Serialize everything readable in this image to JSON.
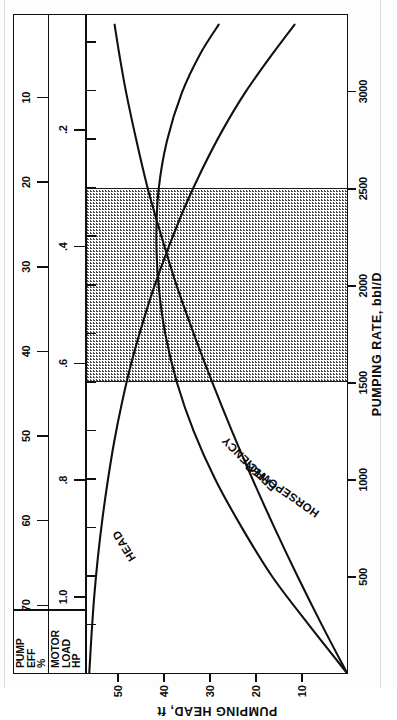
{
  "figure": {
    "title_note": "Centrifugal pump performance curves",
    "orientation": "rotated-90-ccw"
  },
  "aux_scales": [
    {
      "id": "pump-eff",
      "title": "PUMP\nEFF\n%",
      "unit": "%",
      "ticks": [
        70,
        60,
        50,
        40,
        30,
        20,
        10
      ],
      "tick_labels": [
        "70",
        "60",
        "50",
        "40",
        "30",
        "20",
        "10"
      ]
    },
    {
      "id": "motor-load",
      "title": "MOTOR\nLOAD\nHP",
      "unit": "HP",
      "ticks": [
        1.0,
        0.8,
        0.6,
        0.4,
        0.2
      ],
      "tick_labels": [
        "1.0",
        ".8",
        ".6",
        ".4",
        ".2"
      ]
    }
  ],
  "chart_data": {
    "type": "line",
    "title": "",
    "xlabel": "PUMPING RATE, bbl/D",
    "ylabel": "PUMPING HEAD, ft",
    "xlim": [
      0,
      3400
    ],
    "ylim": [
      0,
      57
    ],
    "xticks": [
      500,
      1000,
      1500,
      2000,
      2500,
      3000
    ],
    "xtick_labels": [
      "500",
      "1000",
      "1500",
      "2000",
      "2500",
      "3000"
    ],
    "yticks": [
      10,
      20,
      30,
      40,
      50
    ],
    "ytick_labels": [
      "10",
      "20",
      "30",
      "40",
      "50"
    ],
    "grid": false,
    "legend": "inline-curve-labels",
    "shaded_region": {
      "label": "recommended operating range",
      "x_start": 1500,
      "x_end": 2500,
      "fill": "#ffffff",
      "pattern": "dotted-stipple"
    },
    "series": [
      {
        "name": "HEAD",
        "label": "HEAD",
        "axis": "PUMPING HEAD, ft",
        "color": "#101010",
        "x": [
          0,
          200,
          400,
          600,
          800,
          1000,
          1200,
          1400,
          1600,
          1800,
          2000,
          2200,
          2400,
          2600,
          2800,
          3000,
          3200,
          3350
        ],
        "y": [
          56.5,
          56.0,
          55.4,
          54.6,
          53.6,
          52.4,
          51.0,
          49.3,
          47.3,
          44.9,
          42.2,
          39.1,
          35.7,
          31.8,
          27.4,
          22.3,
          16.3,
          11.5
        ]
      },
      {
        "name": "EFFICIENCY",
        "label": "EFFICIENCY",
        "axis": "PUMP EFF %",
        "color": "#101010",
        "x": [
          0,
          250,
          500,
          750,
          1000,
          1250,
          1500,
          1750,
          2000,
          2250,
          2500,
          2750,
          3000,
          3200,
          3350
        ],
        "y": [
          0,
          11.5,
          22.5,
          31.5,
          39.5,
          46.0,
          51.0,
          54.5,
          56.5,
          57.2,
          56.5,
          54.0,
          49.5,
          44.0,
          38.5
        ]
      },
      {
        "name": "HORSEPOWER",
        "label": "HORSEPOWER",
        "axis": "MOTOR LOAD HP",
        "color": "#101010",
        "x": [
          0,
          250,
          500,
          750,
          1000,
          1250,
          1500,
          1750,
          2000,
          2250,
          2500,
          2750,
          3000,
          3200,
          3350
        ],
        "y": [
          0.0,
          0.11,
          0.215,
          0.315,
          0.41,
          0.5,
          0.585,
          0.665,
          0.74,
          0.805,
          0.865,
          0.915,
          0.96,
          0.99,
          1.01
        ]
      }
    ]
  }
}
